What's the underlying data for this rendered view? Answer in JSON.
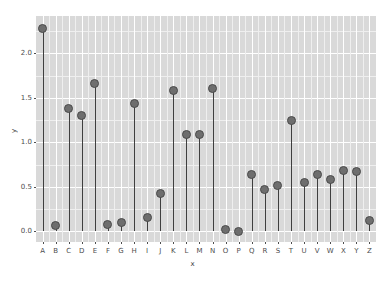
{
  "chart_data": {
    "type": "scatter",
    "plot_style": "stem-lollipop",
    "title": "",
    "xlabel": "x",
    "ylabel": "y",
    "categories": [
      "A",
      "B",
      "C",
      "D",
      "E",
      "F",
      "G",
      "H",
      "I",
      "J",
      "K",
      "L",
      "M",
      "N",
      "O",
      "P",
      "Q",
      "R",
      "S",
      "T",
      "U",
      "V",
      "W",
      "X",
      "Y",
      "Z"
    ],
    "values": [
      2.28,
      0.07,
      1.38,
      1.3,
      1.66,
      0.08,
      0.1,
      1.44,
      0.15,
      0.43,
      1.58,
      1.09,
      1.09,
      1.6,
      0.02,
      0.0,
      0.64,
      0.47,
      0.51,
      1.25,
      0.55,
      0.64,
      0.58,
      0.68,
      0.67,
      0.12
    ],
    "ylim": [
      -0.12,
      2.42
    ],
    "yticks": [
      0.0,
      0.5,
      1.0,
      1.5,
      2.0
    ],
    "ytick_labels": [
      "0.0",
      "0.5",
      "1.0",
      "1.5",
      "2.0"
    ],
    "grid": true,
    "grid_major_color": "#ffffff",
    "grid_minor_color": "#efefef",
    "panel_color": "#d9d9d9",
    "marker_fill": "#6e6e6e",
    "marker_edge": "#4a4a4a",
    "stem_color": "#3f3f3f",
    "legend": "none"
  }
}
